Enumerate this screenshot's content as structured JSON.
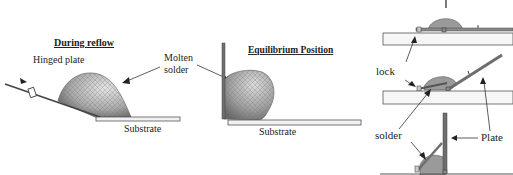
{
  "diagram": {
    "left_panel": {
      "title": "During reflow",
      "hinged_plate_label": "Hinged plate",
      "substrate_label": "Substrate"
    },
    "shared": {
      "molten_solder_line1": "Molten",
      "molten_solder_line2": "solder"
    },
    "middle_panel": {
      "title": "Equilibrium Position",
      "substrate_label": "Substrate"
    },
    "right_panel": {
      "lock_label": "lock",
      "solder_label": "solder",
      "plate_label": "Plate"
    },
    "colors": {
      "solder_fill": "#9a9a9a",
      "solder_light": "#d8d8d8",
      "substrate_fill": "#f2f2f2",
      "outline": "#333333",
      "plate": "#6e6e6e"
    }
  }
}
